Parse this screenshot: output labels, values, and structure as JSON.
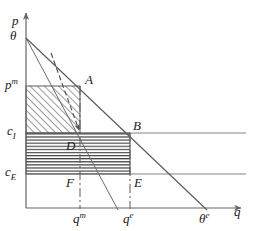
{
  "figure": {
    "axes": {
      "y_label": "p",
      "x_label": "q",
      "y_axis_name": "price-axis",
      "x_axis_name": "quantity-axis"
    },
    "colors": {
      "line": "#555555",
      "axis": "#666666",
      "hatch_diagonal": "#4a4a4a",
      "hatch_horizontal": "#3c3c3c",
      "text": "#1a1a1a",
      "background": "#ffffff"
    },
    "y_ticks": [
      {
        "label": "θ",
        "sup": "",
        "name": "tick-theta",
        "y": 38
      },
      {
        "label": "p",
        "sup": "m",
        "name": "tick-pm",
        "y": 86
      },
      {
        "label": "c",
        "sub": "I",
        "name": "tick-ci",
        "y": 133
      },
      {
        "label": "c",
        "sub": "E",
        "name": "tick-ce",
        "y": 174
      }
    ],
    "x_ticks": [
      {
        "label": "q",
        "sup": "m",
        "name": "tick-qm",
        "x": 80
      },
      {
        "label": "q",
        "sup": "e",
        "name": "tick-qe",
        "x": 130
      },
      {
        "label": "θ",
        "sup": "e",
        "name": "tick-theta-e",
        "x": 205
      }
    ],
    "points": [
      {
        "label": "A",
        "name": "point-a",
        "x": 80,
        "y": 86
      },
      {
        "label": "B",
        "name": "point-b",
        "x": 130,
        "y": 133
      },
      {
        "label": "D",
        "name": "point-d",
        "x": 80,
        "y": 133
      },
      {
        "label": "F",
        "name": "point-f",
        "x": 80,
        "y": 174
      },
      {
        "label": "E",
        "name": "point-e",
        "x": 130,
        "y": 174
      }
    ],
    "lines": [
      {
        "name": "demand-curve",
        "from": [
          26,
          38
        ],
        "to": [
          205,
          208
        ],
        "style": "solid"
      },
      {
        "name": "marginal-revenue-curve",
        "from": [
          26,
          38
        ],
        "to": [
          117,
          208
        ],
        "style": "solid"
      },
      {
        "name": "cost-line-ci",
        "from": [
          26,
          133
        ],
        "to": [
          246,
          133
        ],
        "style": "solid"
      },
      {
        "name": "cost-line-ce",
        "from": [
          26,
          174
        ],
        "to": [
          246,
          174
        ],
        "style": "solid"
      },
      {
        "name": "qm-dropline",
        "from": [
          80,
          86
        ],
        "to": [
          80,
          208
        ],
        "style": "dashed"
      },
      {
        "name": "qe-dropline",
        "from": [
          130,
          133
        ],
        "to": [
          130,
          208
        ],
        "style": "dashed"
      },
      {
        "name": "annotation-arrow",
        "from": [
          52,
          55
        ],
        "to": [
          79,
          131
        ],
        "style": "dashed-arrow"
      }
    ],
    "regions": [
      {
        "name": "monopoly-profit-rectangle",
        "fill": "diagonal-hatch",
        "x": 26,
        "y": 86,
        "w": 54,
        "h": 47
      },
      {
        "name": "entry-deterrence-rectangle",
        "fill": "horizontal-hatch",
        "x": 26,
        "y": 133,
        "w": 104,
        "h": 41
      }
    ]
  }
}
